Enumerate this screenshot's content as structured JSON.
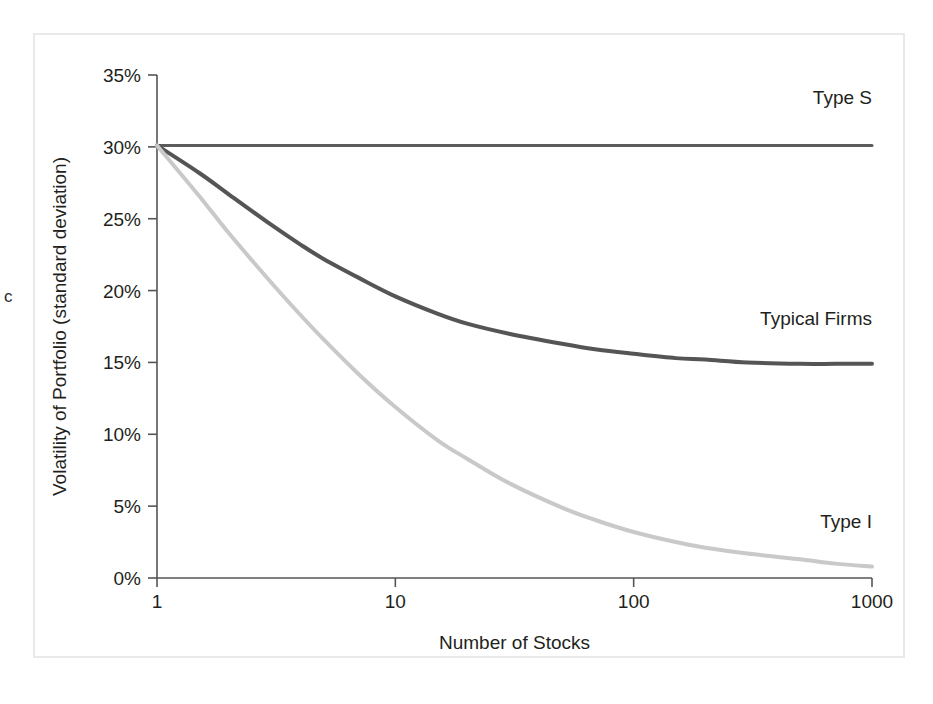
{
  "figure": {
    "margin_glyph": "c"
  },
  "chart_data": {
    "type": "line",
    "title": "",
    "xlabel": "Number of Stocks",
    "ylabel": "Volatility of Portfolio (standard deviation)",
    "xscale": "log",
    "xlim": [
      1,
      1000
    ],
    "ylim": [
      0,
      35
    ],
    "grid": false,
    "legend_position": "inline-right",
    "xticks": [
      1,
      10,
      100,
      1000
    ],
    "xtick_labels": [
      "1",
      "10",
      "100",
      "1000"
    ],
    "yticks": [
      0,
      5,
      10,
      15,
      20,
      25,
      30,
      35
    ],
    "ytick_labels": [
      "0%",
      "5%",
      "10%",
      "15%",
      "20%",
      "25%",
      "30%",
      "35%"
    ],
    "x": [
      1,
      1.5,
      2,
      3,
      4,
      5,
      7,
      10,
      15,
      20,
      30,
      50,
      70,
      100,
      150,
      200,
      300,
      500,
      700,
      1000
    ],
    "series": [
      {
        "name": "Type S",
        "label": "Type S",
        "color": "#5c5c5c",
        "line_width": 3.0,
        "values": [
          30.1,
          30.1,
          30.1,
          30.1,
          30.1,
          30.1,
          30.1,
          30.1,
          30.1,
          30.1,
          30.1,
          30.1,
          30.1,
          30.1,
          30.1,
          30.1,
          30.1,
          30.1,
          30.1,
          30.1
        ]
      },
      {
        "name": "Typical Firms",
        "label": "Typical Firms",
        "color": "#555555",
        "line_width": 4.0,
        "values": [
          30.1,
          28.2,
          26.7,
          24.6,
          23.2,
          22.2,
          20.9,
          19.6,
          18.4,
          17.7,
          17.0,
          16.3,
          15.9,
          15.6,
          15.3,
          15.2,
          15.0,
          14.9,
          14.9,
          14.9
        ]
      },
      {
        "name": "Type I",
        "label": "Type I",
        "color": "#c9c9c9",
        "line_width": 4.0,
        "values": [
          30.1,
          26.6,
          24.0,
          20.6,
          18.3,
          16.6,
          14.2,
          11.9,
          9.6,
          8.3,
          6.6,
          4.9,
          4.0,
          3.2,
          2.5,
          2.1,
          1.7,
          1.3,
          1.0,
          0.8
        ]
      }
    ],
    "annotations": [
      {
        "text": "Type S",
        "x_value": 1000,
        "y_value": 33.0,
        "anchor": "end"
      },
      {
        "text": "Typical Firms",
        "x_value": 1000,
        "y_value": 17.6,
        "anchor": "end"
      },
      {
        "text": "Type I",
        "x_value": 1000,
        "y_value": 3.5,
        "anchor": "end"
      }
    ]
  }
}
